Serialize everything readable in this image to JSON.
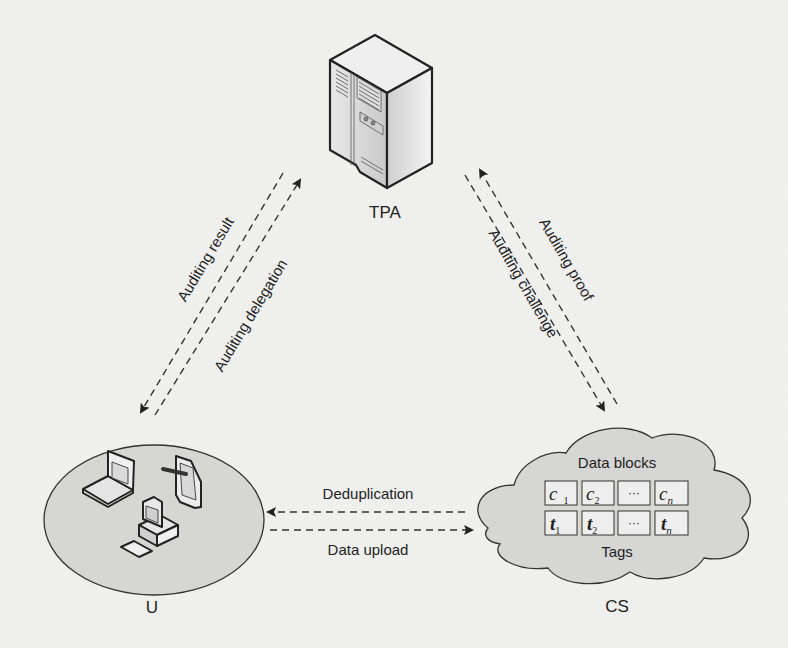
{
  "diagram": {
    "type": "system-model",
    "nodes": {
      "tpa": {
        "label": "TPA",
        "icon": "server-icon"
      },
      "user": {
        "label": "U",
        "icons": [
          "laptop-icon",
          "tablet-icon",
          "desktop-computer-icon"
        ]
      },
      "cs": {
        "label": "CS",
        "shape": "cloud",
        "data_blocks_label": "Data blocks",
        "tags_label": "Tags",
        "data_blocks": [
          {
            "base": "c",
            "sub": "1"
          },
          {
            "base": "c",
            "sub": "2"
          },
          {
            "base": "···",
            "sub": ""
          },
          {
            "base": "c",
            "sub": "n"
          }
        ],
        "tags": [
          {
            "base": "t",
            "sub": "1"
          },
          {
            "base": "t",
            "sub": "2"
          },
          {
            "base": "···",
            "sub": ""
          },
          {
            "base": "t",
            "sub": "n"
          }
        ]
      }
    },
    "edges": [
      {
        "id": "auditing-result",
        "label": "Auditing result",
        "from": "TPA",
        "to": "U",
        "style": "dashed"
      },
      {
        "id": "auditing-delegation",
        "label": "Auditing delegation",
        "from": "U",
        "to": "TPA",
        "style": "dashed"
      },
      {
        "id": "auditing-proof",
        "label": "Auditing proof",
        "from": "CS",
        "to": "TPA",
        "style": "dashed"
      },
      {
        "id": "auditing-challenge",
        "label": "Auditing challenge",
        "from": "TPA",
        "to": "CS",
        "style": "dashed"
      },
      {
        "id": "deduplication",
        "label": "Deduplication",
        "from": "CS",
        "to": "U",
        "style": "dashed"
      },
      {
        "id": "data-upload",
        "label": "Data upload",
        "from": "U",
        "to": "CS",
        "style": "dashed"
      }
    ],
    "colors": {
      "background": "#f1f1ef",
      "node_fill": "#d6d6d4",
      "stroke": "#2a2a2a",
      "text": "#1e1e1e"
    }
  }
}
